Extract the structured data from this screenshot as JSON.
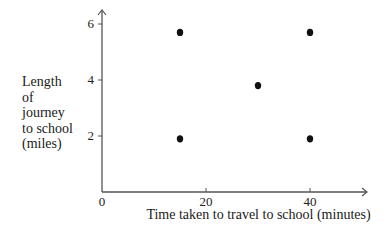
{
  "chart_data": {
    "type": "scatter",
    "title": "",
    "xlabel": "Time taken to travel to school (minutes)",
    "ylabel": "Length of journey to school (miles)",
    "ylabel_lines": [
      "Length",
      "of",
      "journey",
      "to school",
      "(miles)"
    ],
    "xlim": [
      0,
      50
    ],
    "ylim": [
      0,
      6.5
    ],
    "x_ticks": [
      0,
      20,
      40
    ],
    "y_ticks": [
      2,
      4,
      6
    ],
    "x_tick_labels": [
      "20",
      "40"
    ],
    "y_tick_labels": [
      "2",
      "4",
      "6"
    ],
    "origin_label": "0",
    "grid": false,
    "legend": null,
    "points": [
      {
        "x": 15,
        "y": 5.7
      },
      {
        "x": 15,
        "y": 1.9
      },
      {
        "x": 30,
        "y": 3.8
      },
      {
        "x": 40,
        "y": 5.7
      },
      {
        "x": 40,
        "y": 1.9
      }
    ],
    "colors": {
      "points": "#111111",
      "axes": "#555555"
    }
  }
}
